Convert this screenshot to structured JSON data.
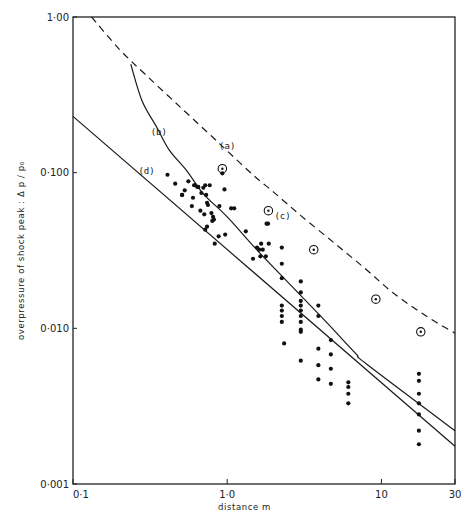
{
  "chart_data": {
    "type": "scatter",
    "title": "",
    "xlabel": "distance  m",
    "ylabel": "overpressure of shock peak : Δ p / p₀",
    "xscale": "log",
    "yscale": "log",
    "xlim": [
      0.1,
      30
    ],
    "ylim": [
      0.001,
      1.0
    ],
    "grid": false,
    "legend": "none (curves labelled inline (a)-(d))",
    "x_ticks": [
      {
        "value": 0.1,
        "label": "0·1"
      },
      {
        "value": 1.0,
        "label": "1·0"
      },
      {
        "value": 10,
        "label": "10"
      },
      {
        "value": 30,
        "label": "30"
      }
    ],
    "y_ticks": [
      {
        "value": 1.0,
        "label": "1·00"
      },
      {
        "value": 0.1,
        "label": "0·100"
      },
      {
        "value": 0.01,
        "label": "0·010"
      },
      {
        "value": 0.001,
        "label": "0·001"
      }
    ],
    "series": [
      {
        "name": "(a)",
        "kind": "line",
        "style": "dashed",
        "label_pos": [
          1.0,
          0.142
        ],
        "x": [
          0.132,
          0.2,
          0.3,
          0.5,
          0.8,
          1.0,
          1.5,
          2.0,
          3.0,
          5.0,
          8.0,
          12,
          20,
          30
        ],
        "y": [
          1.0,
          0.62,
          0.42,
          0.262,
          0.17,
          0.138,
          0.095,
          0.075,
          0.053,
          0.035,
          0.0238,
          0.0168,
          0.0118,
          0.0093
        ]
      },
      {
        "name": "(b)",
        "kind": "line",
        "style": "solid",
        "label_pos": [
          0.36,
          0.175
        ],
        "x": [
          0.237,
          0.28,
          0.35,
          0.42,
          0.55,
          0.7,
          1.0,
          1.6,
          2.6,
          4.2,
          6.8,
          8.0,
          30
        ],
        "y": [
          0.497,
          0.29,
          0.195,
          0.14,
          0.102,
          0.073,
          0.052,
          0.031,
          0.0188,
          0.0115,
          0.0069,
          0.0059,
          0.0022
        ]
      },
      {
        "name": "(d)",
        "kind": "line",
        "style": "solid",
        "label_pos": [
          0.3,
          0.098
        ],
        "x": [
          0.1,
          30
        ],
        "y": [
          0.23,
          0.00175
        ]
      }
    ],
    "points": {
      "name": "measured (filled dots)",
      "x": [
        0.41,
        0.46,
        0.51,
        0.51,
        0.53,
        0.56,
        0.59,
        0.6,
        0.61,
        0.62,
        0.64,
        0.65,
        0.67,
        0.68,
        0.7,
        0.71,
        0.72,
        0.72,
        0.73,
        0.74,
        0.74,
        0.75,
        0.77,
        0.79,
        0.8,
        0.81,
        0.82,
        0.83,
        0.88,
        0.89,
        0.93,
        0.96,
        0.97,
        1.06,
        1.11,
        1.32,
        1.47,
        1.56,
        1.61,
        1.64,
        1.66,
        1.7,
        1.78,
        1.8,
        1.84,
        1.86,
        2.26,
        2.26,
        2.26,
        2.26,
        2.26,
        2.26,
        2.26,
        2.34,
        3.0,
        3.0,
        3.0,
        3.0,
        3.0,
        3.0,
        3.0,
        3.0,
        3.0,
        3.0,
        3.9,
        3.9,
        3.9,
        3.9,
        3.9,
        4.7,
        4.7,
        4.7,
        4.7,
        6.1,
        6.1,
        6.1,
        6.1,
        17.5,
        17.5,
        17.5,
        17.5,
        17.5,
        17.5,
        17.5
      ],
      "y": [
        0.097,
        0.085,
        0.072,
        0.072,
        0.077,
        0.088,
        0.061,
        0.069,
        0.083,
        0.083,
        0.081,
        0.081,
        0.057,
        0.074,
        0.08,
        0.054,
        0.043,
        0.083,
        0.072,
        0.045,
        0.064,
        0.062,
        0.083,
        0.055,
        0.049,
        0.052,
        0.05,
        0.035,
        0.039,
        0.061,
        0.099,
        0.078,
        0.04,
        0.059,
        0.059,
        0.042,
        0.028,
        0.033,
        0.032,
        0.029,
        0.035,
        0.032,
        0.029,
        0.047,
        0.047,
        0.035,
        0.026,
        0.033,
        0.021,
        0.014,
        0.013,
        0.012,
        0.011,
        0.008,
        0.02,
        0.017,
        0.015,
        0.014,
        0.013,
        0.012,
        0.011,
        0.0098,
        0.0095,
        0.0062,
        0.014,
        0.012,
        0.0074,
        0.0058,
        0.0047,
        0.0084,
        0.0068,
        0.0055,
        0.0044,
        0.0045,
        0.0042,
        0.0038,
        0.0033,
        0.0051,
        0.0046,
        0.0038,
        0.0033,
        0.0028,
        0.0022,
        0.0018
      ]
    },
    "annotated_points": {
      "name": "circled dots",
      "x": [
        0.93,
        1.85,
        3.64,
        9.2,
        18
      ],
      "y": [
        0.106,
        0.057,
        0.032,
        0.0154,
        0.0095
      ],
      "label": {
        "index": 1,
        "text": "(c)"
      }
    }
  }
}
